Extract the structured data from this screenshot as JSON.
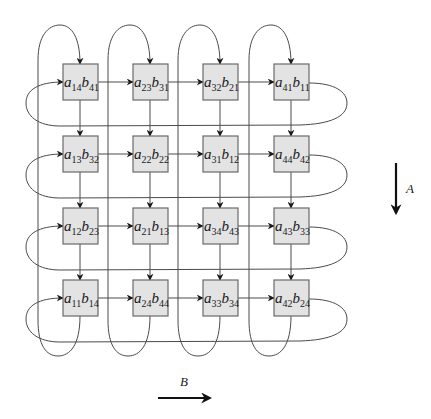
{
  "diagram": {
    "type": "systolic-array",
    "rows": 4,
    "cols": 4,
    "cells": [
      [
        {
          "a": "14",
          "b": "41"
        },
        {
          "a": "23",
          "b": "31"
        },
        {
          "a": "32",
          "b": "21"
        },
        {
          "a": "41",
          "b": "11"
        }
      ],
      [
        {
          "a": "13",
          "b": "32"
        },
        {
          "a": "22",
          "b": "22"
        },
        {
          "a": "31",
          "b": "12"
        },
        {
          "a": "44",
          "b": "42"
        }
      ],
      [
        {
          "a": "12",
          "b": "23"
        },
        {
          "a": "21",
          "b": "13"
        },
        {
          "a": "34",
          "b": "43"
        },
        {
          "a": "43",
          "b": "33"
        }
      ],
      [
        {
          "a": "11",
          "b": "14"
        },
        {
          "a": "24",
          "b": "44"
        },
        {
          "a": "33",
          "b": "34"
        },
        {
          "a": "42",
          "b": "24"
        }
      ]
    ],
    "cell_prefix_a": "a",
    "cell_prefix_b": "b",
    "axis_a": {
      "label": "A",
      "direction": "down"
    },
    "axis_b": {
      "label": "B",
      "direction": "right"
    },
    "colors": {
      "cell_fill": "#e3e3e3",
      "cell_border": "#6a6a6a",
      "wire": "#4a4a4a",
      "arrow": "#111111"
    }
  }
}
